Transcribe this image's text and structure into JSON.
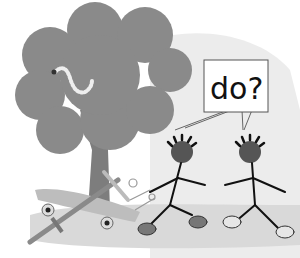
{
  "illustration": {
    "description": "Grayscale cartoon: two stick-figure kids reaching toward each other beside a tree with a worm, a broken skateboard and a toy sword on the ground",
    "speech_bubble": {
      "text": "do?"
    },
    "colors": {
      "background": "#ffffff",
      "backdrop_blob": "#ececec",
      "tree_canopy": "#8a8a8a",
      "tree_trunk": "#7d7d7d",
      "ground": "#d9d9d9",
      "skateboard": "#bdbdbd",
      "figure_line": "#111111",
      "face": "#555555",
      "shoe_left": "#777777",
      "shoe_right": "#e6e6e6"
    }
  }
}
